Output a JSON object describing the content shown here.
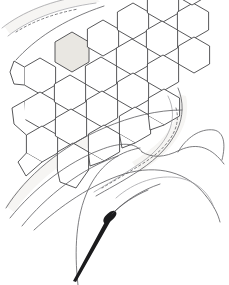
{
  "figure": {
    "title": "Hexagonal cell array with wing veins",
    "type": "line-art-illustration",
    "width": 229,
    "height": 285,
    "background_color": "#ffffff",
    "line_color": "#3a3a3c",
    "faint_line_color": "#9a9a9e",
    "shaded_cell_color": "#e9e7e2",
    "seta_color": "#1b1b1d"
  },
  "hex_array": {
    "label": "hexagonal cell array",
    "cell_count": 22,
    "shaded_cell_index": 7,
    "radius": 18,
    "cells": [
      {
        "cx": 40,
        "cy": 76,
        "r": 18,
        "rot": 0,
        "shaded": false
      },
      {
        "cx": 40,
        "cy": 110,
        "r": 18,
        "rot": 0,
        "shaded": false
      },
      {
        "cx": 70,
        "cy": 59,
        "r": 18,
        "rot": 0,
        "shaded": false
      },
      {
        "cx": 70,
        "cy": 93,
        "r": 18,
        "rot": 0,
        "shaded": false
      },
      {
        "cx": 70,
        "cy": 127,
        "r": 18,
        "rot": 0,
        "shaded": false
      },
      {
        "cx": 100,
        "cy": 42,
        "r": 18,
        "rot": 0,
        "shaded": false
      },
      {
        "cx": 100,
        "cy": 76,
        "r": 18,
        "rot": 0,
        "shaded": false
      },
      {
        "cx": 70,
        "cy": 48,
        "r": 19,
        "rot": 0,
        "shaded": true
      },
      {
        "cx": 100,
        "cy": 110,
        "r": 18,
        "rot": 0,
        "shaded": false
      },
      {
        "cx": 130,
        "cy": 25,
        "r": 18,
        "rot": 0,
        "shaded": false
      },
      {
        "cx": 130,
        "cy": 59,
        "r": 18,
        "rot": 0,
        "shaded": false
      },
      {
        "cx": 130,
        "cy": 93,
        "r": 18,
        "rot": 0,
        "shaded": false
      },
      {
        "cx": 160,
        "cy": 10,
        "r": 18,
        "rot": 0,
        "shaded": false
      },
      {
        "cx": 160,
        "cy": 42,
        "r": 18,
        "rot": 0,
        "shaded": false
      },
      {
        "cx": 160,
        "cy": 76,
        "r": 18,
        "rot": 0,
        "shaded": false
      },
      {
        "cx": 190,
        "cy": 25,
        "r": 18,
        "rot": 0,
        "shaded": false
      },
      {
        "cx": 190,
        "cy": -8,
        "r": 18,
        "rot": 0,
        "shaded": false
      }
    ]
  },
  "veins": {
    "label": "wing vein curves",
    "count": 9,
    "description": "sweeping curved vein lines crossing the lower two thirds"
  },
  "stipple": {
    "label": "dashed marginal line",
    "count": 2,
    "description": "short dashed lines following the upper-left and right margins"
  },
  "seta": {
    "label": "tapered seta spine",
    "color": "#1b1b1d",
    "tip_x": 74,
    "tip_y": 280,
    "base_x": 112,
    "base_y": 214
  }
}
